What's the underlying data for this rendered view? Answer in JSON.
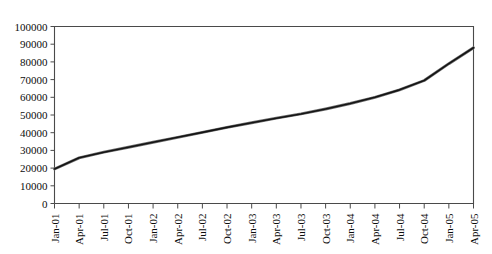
{
  "chart_data": {
    "type": "line",
    "title": "",
    "subtitle": "",
    "xlabel": "",
    "ylabel": "",
    "grid": false,
    "legend": false,
    "legend_position": "none",
    "ylim": [
      0,
      100000
    ],
    "y_ticks": [
      0,
      10000,
      20000,
      30000,
      40000,
      50000,
      60000,
      70000,
      80000,
      90000,
      100000
    ],
    "y_tick_labels": [
      "0",
      "10000",
      "20000",
      "30000",
      "40000",
      "50000",
      "60000",
      "70000",
      "80000",
      "90000",
      "100000"
    ],
    "categories": [
      "Jan-01",
      "Apr-01",
      "Jul-01",
      "Oct-01",
      "Jan-02",
      "Apr-02",
      "Jul-02",
      "Oct-02",
      "Jan-03",
      "Apr-03",
      "Jul-03",
      "Oct-03",
      "Jan-04",
      "Apr-04",
      "Jul-04",
      "Oct-04",
      "Jan-05",
      "Apr-05"
    ],
    "series": [
      {
        "name": "series-1",
        "color": "#141414",
        "values": [
          19500,
          25800,
          29000,
          31800,
          34600,
          37400,
          40200,
          43000,
          45600,
          48200,
          50600,
          53400,
          56500,
          60000,
          64200,
          69500,
          79000,
          88000
        ]
      }
    ]
  },
  "axes": {
    "x_axis_name": "date-axis",
    "y_axis_name": "value-axis"
  }
}
